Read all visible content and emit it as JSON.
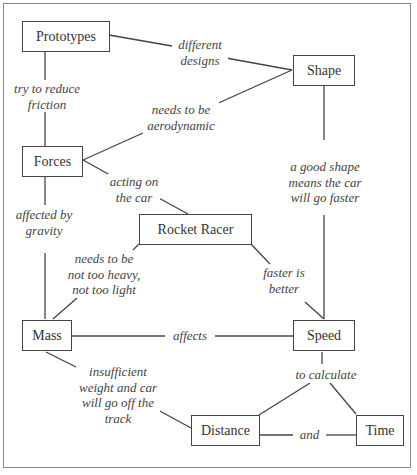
{
  "diagram": {
    "nodes": {
      "prototypes": "Prototypes",
      "shape": "Shape",
      "forces": "Forces",
      "rocket_racer": "Rocket Racer",
      "mass": "Mass",
      "speed": "Speed",
      "distance": "Distance",
      "time": "Time"
    },
    "edges": {
      "prototypes_shape": "different\ndesigns",
      "prototypes_forces": "try to reduce\nfriction",
      "forces_shape": "needs to be\naerodynamic",
      "forces_rocket": "acting on\nthe car",
      "shape_speed": "a good shape\nmeans the car\nwill go faster",
      "forces_mass": "affected by\ngravity",
      "rocket_mass": "needs to be\nnot too heavy,\nnot too light",
      "rocket_speed": "faster is\nbetter",
      "mass_speed": "affects",
      "mass_distance": "insufficient\nweight and car\nwill go off the\ntrack",
      "speed_calc": "to calculate",
      "distance_time": "and"
    }
  }
}
